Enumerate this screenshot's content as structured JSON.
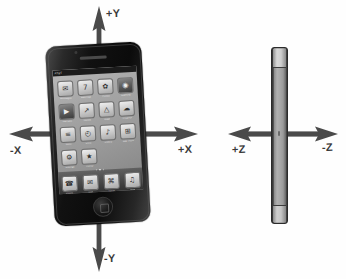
{
  "diagram": {
    "background_color": "#ffffff",
    "arrow_color": "#4a4a4a",
    "label_color": "#3a3a3a"
  },
  "axes": {
    "plus_y": "+Y",
    "minus_y": "-Y",
    "plus_x": "-X",
    "minus_x": "+X",
    "plus_z": "+Z",
    "minus_z": "-Z"
  },
  "labels": {
    "plus_y": "+Y",
    "minus_y": "-Y",
    "minus_x": "-X",
    "plus_x": "+X",
    "plus_z": "+Z",
    "minus_z": "-Z"
  },
  "front_view": {
    "name": "iPhone front view",
    "status_bar": {
      "carrier": "AT&T",
      "time": "",
      "battery": ""
    },
    "page_dots": 3,
    "active_dot": 1,
    "apps": [
      {
        "name": "Messages",
        "glyph": "✉",
        "label": "Messages",
        "dark": false
      },
      {
        "name": "Calendar",
        "glyph": "7",
        "label": "Calendar",
        "dark": false
      },
      {
        "name": "Photos",
        "glyph": "✿",
        "label": "Photos",
        "dark": false
      },
      {
        "name": "Camera",
        "glyph": "◉",
        "label": "Camera",
        "dark": true
      },
      {
        "name": "YouTube",
        "glyph": "▶",
        "label": "YouTube",
        "dark": true
      },
      {
        "name": "Stocks",
        "glyph": "↗",
        "label": "Stocks",
        "dark": false
      },
      {
        "name": "Maps",
        "glyph": "△",
        "label": "Maps",
        "dark": false
      },
      {
        "name": "Weather",
        "glyph": "☁",
        "label": "Weather",
        "dark": false
      },
      {
        "name": "Notes",
        "glyph": "≡",
        "label": "Notes",
        "dark": false
      },
      {
        "name": "Clock",
        "glyph": "◴",
        "label": "Clock",
        "dark": false
      },
      {
        "name": "Utilities",
        "glyph": "♪",
        "label": "Utilities",
        "dark": false
      },
      {
        "name": "App Store",
        "glyph": "⊞",
        "label": "App Store",
        "dark": false
      },
      {
        "name": "Settings",
        "glyph": "⚙",
        "label": "Settings",
        "dark": false
      },
      {
        "name": "iTunes",
        "glyph": "★",
        "label": "iTunes",
        "dark": false
      }
    ],
    "dock": [
      {
        "name": "Phone",
        "glyph": "☎",
        "label": "Phone"
      },
      {
        "name": "Mail",
        "glyph": "✉",
        "label": "Mail"
      },
      {
        "name": "Safari",
        "glyph": "⌘",
        "label": "Safari"
      },
      {
        "name": "iPod",
        "glyph": "♫",
        "label": "iPod"
      }
    ]
  },
  "side_view": {
    "name": "iPhone side view"
  }
}
